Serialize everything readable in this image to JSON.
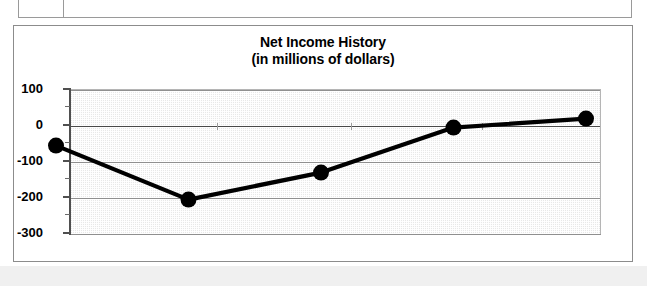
{
  "document": {
    "table_fragment_name": "table-fragment-above-chart"
  },
  "chart_data": {
    "type": "line",
    "title": "Net Income History",
    "subtitle": "(in millions of dollars)",
    "xlabel": "",
    "ylabel": "",
    "categories": [
      "1998",
      "1999",
      "2000",
      "2001",
      "2002"
    ],
    "values": [
      -60,
      -210,
      -135,
      -10,
      15
    ],
    "series": [
      {
        "name": "Net Income",
        "values": [
          -60,
          -210,
          -135,
          -10,
          15
        ]
      }
    ],
    "ylim": [
      -300,
      100
    ],
    "ytick_labels": [
      "100",
      "0",
      "-100",
      "-200",
      "-300"
    ],
    "ytick_values": [
      100,
      0,
      -100,
      -200,
      -300
    ],
    "yminor_tick_values": [
      50,
      -50,
      -150,
      -250
    ],
    "grid": true,
    "legend": "none",
    "marker": "filled-circle",
    "marker_color": "#000000",
    "line_color": "#000000",
    "plot_background": "#e8e8e8",
    "zero_line_color": "#4a4a4a"
  }
}
